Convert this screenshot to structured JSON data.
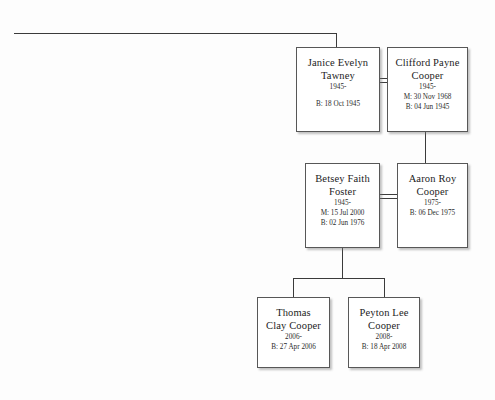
{
  "chart": {
    "line_color": "#3b3b3b",
    "box_border_color": "#575757",
    "background_color": "#fdfdfd"
  },
  "people": [
    {
      "id": "janice",
      "name": "Janice Evelyn\nTawney",
      "years": "1945-",
      "facts": "B: 18 Oct 1945"
    },
    {
      "id": "clifford",
      "name": "Clifford Payne\nCooper",
      "years": "1945-",
      "facts": "M: 30 Nov 1968\nB: 04 Jun 1945"
    },
    {
      "id": "betsey",
      "name": "Betsey Faith\nFoster",
      "years": "1945-",
      "facts": "M: 15 Jul 2000\nB: 02 Jun 1976"
    },
    {
      "id": "aaron",
      "name": "Aaron Roy\nCooper",
      "years": "1975-",
      "facts": "B: 06 Dec 1975"
    },
    {
      "id": "thomas",
      "name": "Thomas\nClay Cooper",
      "years": "2006-",
      "facts": "B: 27 Apr 2006"
    },
    {
      "id": "peyton",
      "name": "Peyton Lee\nCooper",
      "years": "2008-",
      "facts": "B: 18 Apr 2008"
    }
  ]
}
